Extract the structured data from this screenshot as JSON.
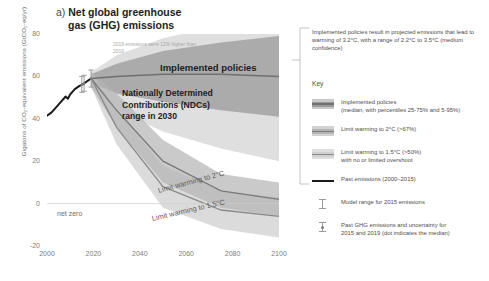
{
  "chart_data": {
    "type": "area",
    "title": "a) Net global greenhouse gas (GHG) emissions",
    "panel_marker": "a)",
    "title_line1": "Net global greenhouse",
    "title_line2": "gas (GHG) emissions",
    "xlabel": "",
    "ylabel": "Gigatons of CO₂-equivalent emissions (GtCO₂-eq/yr)",
    "xlim": [
      2000,
      2100
    ],
    "ylim": [
      -20,
      80
    ],
    "xticks": [
      "2000",
      "2020",
      "2040",
      "2060",
      "2080",
      "2100"
    ],
    "yticks": [
      "80",
      "60",
      "40",
      "20",
      "0",
      "-20"
    ],
    "grid": false,
    "legend_position": "right",
    "annotations": [
      {
        "name": "implemented-policies",
        "text": "Implemented policies",
        "x": 2058,
        "y": 63
      },
      {
        "name": "ndc-range",
        "text": "Nationally Determined Contributions (NDCs) range in 2030",
        "x": 2032,
        "y": 52
      },
      {
        "name": "net-zero",
        "text": "net zero",
        "x": 2003,
        "y": 0
      },
      {
        "name": "limit-2c",
        "text": "Limit warming to 2°C",
        "x": 2048,
        "y": 16
      },
      {
        "name": "limit-15c",
        "text": "Limit warming to 1.5°C",
        "x": 2046,
        "y": 8
      },
      {
        "name": "emissions-note",
        "text": "2019 emissions were 12% higher than 2010",
        "x": 2025,
        "y": 74
      }
    ],
    "series": [
      {
        "name": "Past emissions (2000–2015)",
        "type": "line",
        "color": "#1a1a1a",
        "x": [
          2000,
          2002,
          2004,
          2006,
          2008,
          2009,
          2010,
          2012,
          2014,
          2015,
          2019
        ],
        "values": [
          41.5,
          43.0,
          45.5,
          48.0,
          50.5,
          49.5,
          51.5,
          54.0,
          55.5,
          56.0,
          59.0
        ]
      },
      {
        "name": "Implemented policies",
        "type": "band",
        "color": "#8c8c8c",
        "x": [
          2019,
          2030,
          2050,
          2075,
          2100
        ],
        "median": [
          59,
          60,
          61,
          61,
          60
        ],
        "p25_75_low": [
          57,
          52,
          48,
          44,
          41
        ],
        "p25_75_high": [
          61,
          66,
          72,
          76,
          79
        ],
        "p5_95_low": [
          55,
          44,
          34,
          26,
          20
        ],
        "p5_95_high": [
          62,
          70,
          78,
          84,
          88
        ]
      },
      {
        "name": "Limit warming to 2°C (>67%)",
        "type": "band",
        "color": "#b0b0b0",
        "x": [
          2019,
          2030,
          2050,
          2075,
          2100
        ],
        "median": [
          59,
          44,
          20,
          6,
          2
        ],
        "low": [
          55,
          36,
          10,
          -2,
          -6
        ],
        "high": [
          62,
          52,
          30,
          14,
          10
        ]
      },
      {
        "name": "Limit warming to 1.5°C (>50%) with no or limited overshoot",
        "type": "band",
        "color": "#c9c9c9",
        "x": [
          2019,
          2030,
          2050,
          2075,
          2100
        ],
        "median": [
          59,
          36,
          8,
          -3,
          -6
        ],
        "low": [
          55,
          28,
          -2,
          -12,
          -16
        ],
        "high": [
          62,
          44,
          18,
          6,
          3
        ]
      }
    ],
    "error_bars": [
      {
        "name": "Model range for 2015 emissions",
        "x": 2015,
        "low": 52.5,
        "high": 60.0,
        "median": 56.0
      },
      {
        "name": "Past GHG emissions 2015",
        "x": 2016,
        "low": 53.0,
        "high": 60.5,
        "median": 56.5
      },
      {
        "name": "Past GHG emissions 2019",
        "x": 2019,
        "low": 55.0,
        "high": 63.0,
        "median": 59.0
      }
    ]
  },
  "right_panel": {
    "note": "Implemented policies result in projected emissions that lead to warming of 3.2°C, with a range of 2.2°C to 3.5°C (medium confidence)",
    "key_heading": "Key",
    "key_items": [
      {
        "label_line1": "Implemented policies",
        "label_line2": "(median, with percentiles 25-75% and 5-95%)",
        "swatch": "band-dark"
      },
      {
        "label_line1": "Limit warming to 2°C (>67%)",
        "label_line2": "",
        "swatch": "band-mid"
      },
      {
        "label_line1": "Limit warming to 1.5°C (>50%)",
        "label_line2": "with no or limited overshoot",
        "swatch": "band-light"
      },
      {
        "label_line1": "Past emissions (2000–2015)",
        "label_line2": "",
        "swatch": "solid-line"
      },
      {
        "label_line1": "Model range for 2015 emissions",
        "label_line2": "",
        "swatch": "error-bar"
      },
      {
        "label_line1": "Past GHG emissions and uncertainty for",
        "label_line2": "2015 and 2019 (dot indicates the median)",
        "swatch": "error-bar-dot"
      }
    ]
  },
  "colors": {
    "implemented": "#8c8c8c",
    "two_c": "#b0b0b0",
    "one_five_c": "#c9c9c9",
    "past": "#1a1a1a",
    "text": "#4e4e4e"
  }
}
